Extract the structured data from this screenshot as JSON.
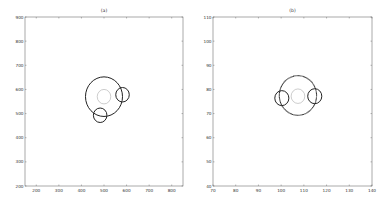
{
  "chart_data": [
    {
      "type": "scatter",
      "title": "(a)",
      "xlabel": "",
      "ylabel": "",
      "xlim": [
        150,
        850
      ],
      "ylim": [
        200,
        900
      ],
      "xticks": [
        200,
        300,
        400,
        500,
        600,
        700,
        800
      ],
      "yticks": [
        200,
        300,
        400,
        500,
        600,
        700,
        800,
        900
      ],
      "grid": false,
      "frame_px": {
        "x0": 25,
        "y0": 17,
        "x1": 183,
        "y1": 186
      },
      "circles": [
        {
          "name": "outer",
          "cx": 500,
          "cy": 570,
          "r": 82,
          "color": "#222222",
          "width": 1.0
        },
        {
          "name": "inner",
          "cx": 500,
          "cy": 570,
          "r": 30,
          "color": "#9a9a9a",
          "width": 0.5
        },
        {
          "name": "satellite-right",
          "cx": 582,
          "cy": 578,
          "r": 30,
          "color": "#222222",
          "width": 1.0
        },
        {
          "name": "satellite-bottom",
          "cx": 483,
          "cy": 493,
          "r": 30,
          "color": "#222222",
          "width": 1.0
        }
      ]
    },
    {
      "type": "scatter",
      "title": "(b)",
      "xlabel": "",
      "ylabel": "",
      "xlim": [
        70,
        140
      ],
      "ylim": [
        40,
        110
      ],
      "xticks": [
        70,
        80,
        90,
        100,
        110,
        120,
        130,
        140
      ],
      "yticks": [
        40,
        50,
        60,
        70,
        80,
        90,
        100,
        110
      ],
      "grid": false,
      "frame_px": {
        "x0": 213,
        "y0": 17,
        "x1": 372,
        "y1": 186
      },
      "circles": [
        {
          "name": "outer",
          "cx": 107.4,
          "cy": 77.5,
          "r": 8.2,
          "color": "#222222",
          "width": 1.1,
          "dotted": true
        },
        {
          "name": "inner",
          "cx": 107.4,
          "cy": 77.2,
          "r": 3.0,
          "color": "#9a9a9a",
          "width": 0.5
        },
        {
          "name": "satellite-left",
          "cx": 100.3,
          "cy": 76.4,
          "r": 3.1,
          "color": "#222222",
          "width": 1.0
        },
        {
          "name": "satellite-right",
          "cx": 114.8,
          "cy": 77.2,
          "r": 3.1,
          "color": "#222222",
          "width": 1.0
        }
      ]
    }
  ]
}
